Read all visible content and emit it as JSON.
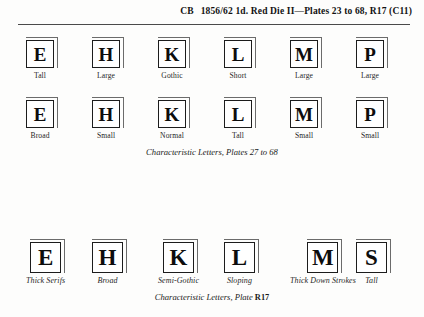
{
  "header": {
    "code": "CB",
    "title": "1856/62 1d. Red Die II—Plates 23 to 68, R17 (C11)"
  },
  "rows": [
    {
      "name": "characteristic-letters-plates-27-to-68-row-1",
      "caption": null,
      "cells": [
        {
          "letter": "E",
          "label": "Tall",
          "italic": false
        },
        {
          "letter": "H",
          "label": "Large",
          "italic": false
        },
        {
          "letter": "K",
          "label": "Gothic",
          "italic": false
        },
        {
          "letter": "L",
          "label": "Short",
          "italic": false
        },
        {
          "letter": "M",
          "label": "Large",
          "italic": false
        },
        {
          "letter": "P",
          "label": "Large",
          "italic": false
        }
      ]
    },
    {
      "name": "characteristic-letters-plates-27-to-68-row-2",
      "caption": null,
      "cells": [
        {
          "letter": "E",
          "label": "Broad",
          "italic": false
        },
        {
          "letter": "H",
          "label": "Small",
          "italic": false
        },
        {
          "letter": "K",
          "label": "Normal",
          "italic": false
        },
        {
          "letter": "L",
          "label": "Tall",
          "italic": false
        },
        {
          "letter": "M",
          "label": "Small",
          "italic": false
        },
        {
          "letter": "P",
          "label": "Small",
          "italic": false
        }
      ]
    },
    {
      "name": "characteristic-letters-plate-r17-row",
      "caption": null,
      "cells": [
        {
          "letter": "E",
          "label": "Thick Serifs",
          "italic": true
        },
        {
          "letter": "H",
          "label": "Broad",
          "italic": true
        },
        {
          "letter": "K",
          "label": "Semi-Gothic",
          "italic": true
        },
        {
          "letter": "L",
          "label": "Sloping",
          "italic": true
        },
        {
          "letter": "M",
          "label": "Thick Down Strokes",
          "italic": true
        },
        {
          "letter": "S",
          "label": "Tall",
          "italic": true
        }
      ]
    }
  ],
  "captions": {
    "upper": {
      "text": "Characteristic Letters, Plates 27 to 68",
      "upright_suffix": ""
    },
    "lower": {
      "text": "Characteristic Letters, Plate",
      "upright_suffix": "R17"
    }
  },
  "colors": {
    "page_background": "#fdfdfc",
    "ink": "#1a1a1a",
    "rule": "#4a4a4a",
    "box_border": "#1c1c1c",
    "box_shadow_line": "#6b6b6b"
  }
}
